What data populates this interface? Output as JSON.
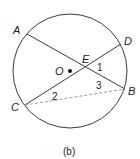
{
  "diagram": {
    "caption": "(b)",
    "circle": {
      "cx": 70,
      "cy": 71,
      "r": 57,
      "stroke": "#3a3a3a"
    },
    "center": {
      "label": "O",
      "x": 70,
      "y": 71
    },
    "points": {
      "A": {
        "label": "A",
        "x": 27,
        "y": 34
      },
      "B": {
        "label": "B",
        "x": 125,
        "y": 89
      },
      "C": {
        "label": "C",
        "x": 25,
        "y": 105
      },
      "D": {
        "label": "D",
        "x": 121,
        "y": 44
      },
      "E": {
        "label": "E",
        "x": 86,
        "y": 68
      }
    },
    "segments": [
      {
        "from": "A",
        "to": "B",
        "style": "solid"
      },
      {
        "from": "C",
        "to": "D",
        "style": "solid"
      },
      {
        "from": "C",
        "to": "B",
        "style": "dashed"
      }
    ],
    "angle_labels": [
      {
        "text": "1",
        "x": 99,
        "y": 70
      },
      {
        "text": "2",
        "x": 54,
        "y": 99
      },
      {
        "text": "3",
        "x": 97,
        "y": 88
      }
    ],
    "colors": {
      "line": "#3a3a3a",
      "dashed": "#9a9a9a",
      "text": "#222222"
    }
  }
}
